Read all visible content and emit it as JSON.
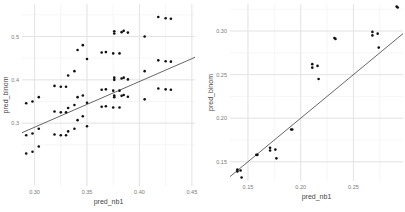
{
  "chart_data": [
    {
      "type": "scatter",
      "title": "",
      "xlabel": "pred_nb1",
      "ylabel": "pred_binom",
      "xlim": [
        0.288,
        0.453
      ],
      "ylim": [
        0.155,
        0.575
      ],
      "x_ticks": [
        0.3,
        0.35,
        0.4,
        0.45
      ],
      "x_tick_labels": [
        "0.30",
        "0.35",
        "0.40",
        "0.45"
      ],
      "y_ticks": [
        0.3,
        0.4,
        0.5
      ],
      "y_tick_labels": [
        "0.3",
        "0.4",
        "0.5"
      ],
      "grid": true,
      "legend": null,
      "fit_line": {
        "x": [
          0.288,
          0.453
        ],
        "y": [
          0.278,
          0.452
        ]
      },
      "points": [
        {
          "x": 0.292,
          "y": 0.346
        },
        {
          "x": 0.298,
          "y": 0.35
        },
        {
          "x": 0.304,
          "y": 0.36
        },
        {
          "x": 0.292,
          "y": 0.272
        },
        {
          "x": 0.298,
          "y": 0.276
        },
        {
          "x": 0.304,
          "y": 0.287
        },
        {
          "x": 0.292,
          "y": 0.23
        },
        {
          "x": 0.298,
          "y": 0.234
        },
        {
          "x": 0.304,
          "y": 0.246
        },
        {
          "x": 0.319,
          "y": 0.386
        },
        {
          "x": 0.325,
          "y": 0.384
        },
        {
          "x": 0.33,
          "y": 0.384
        },
        {
          "x": 0.332,
          "y": 0.41
        },
        {
          "x": 0.338,
          "y": 0.42
        },
        {
          "x": 0.341,
          "y": 0.469
        },
        {
          "x": 0.346,
          "y": 0.48
        },
        {
          "x": 0.35,
          "y": 0.448
        },
        {
          "x": 0.319,
          "y": 0.327
        },
        {
          "x": 0.325,
          "y": 0.325
        },
        {
          "x": 0.33,
          "y": 0.325
        },
        {
          "x": 0.332,
          "y": 0.335
        },
        {
          "x": 0.338,
          "y": 0.342
        },
        {
          "x": 0.341,
          "y": 0.36
        },
        {
          "x": 0.346,
          "y": 0.364
        },
        {
          "x": 0.35,
          "y": 0.347
        },
        {
          "x": 0.319,
          "y": 0.274
        },
        {
          "x": 0.325,
          "y": 0.272
        },
        {
          "x": 0.33,
          "y": 0.272
        },
        {
          "x": 0.332,
          "y": 0.281
        },
        {
          "x": 0.338,
          "y": 0.287
        },
        {
          "x": 0.341,
          "y": 0.307
        },
        {
          "x": 0.346,
          "y": 0.316
        },
        {
          "x": 0.35,
          "y": 0.293
        },
        {
          "x": 0.364,
          "y": 0.463
        },
        {
          "x": 0.368,
          "y": 0.464
        },
        {
          "x": 0.375,
          "y": 0.461
        },
        {
          "x": 0.381,
          "y": 0.461
        },
        {
          "x": 0.376,
          "y": 0.512
        },
        {
          "x": 0.376,
          "y": 0.507
        },
        {
          "x": 0.383,
          "y": 0.51
        },
        {
          "x": 0.385,
          "y": 0.513
        },
        {
          "x": 0.389,
          "y": 0.509
        },
        {
          "x": 0.364,
          "y": 0.377
        },
        {
          "x": 0.368,
          "y": 0.378
        },
        {
          "x": 0.375,
          "y": 0.375
        },
        {
          "x": 0.381,
          "y": 0.375
        },
        {
          "x": 0.376,
          "y": 0.405
        },
        {
          "x": 0.376,
          "y": 0.4
        },
        {
          "x": 0.383,
          "y": 0.403
        },
        {
          "x": 0.385,
          "y": 0.405
        },
        {
          "x": 0.389,
          "y": 0.401
        },
        {
          "x": 0.364,
          "y": 0.338
        },
        {
          "x": 0.368,
          "y": 0.339
        },
        {
          "x": 0.375,
          "y": 0.336
        },
        {
          "x": 0.381,
          "y": 0.336
        },
        {
          "x": 0.376,
          "y": 0.364
        },
        {
          "x": 0.376,
          "y": 0.36
        },
        {
          "x": 0.383,
          "y": 0.363
        },
        {
          "x": 0.385,
          "y": 0.365
        },
        {
          "x": 0.389,
          "y": 0.361
        },
        {
          "x": 0.405,
          "y": 0.5
        },
        {
          "x": 0.405,
          "y": 0.42
        },
        {
          "x": 0.405,
          "y": 0.355
        },
        {
          "x": 0.418,
          "y": 0.545
        },
        {
          "x": 0.425,
          "y": 0.542
        },
        {
          "x": 0.43,
          "y": 0.541
        },
        {
          "x": 0.418,
          "y": 0.445
        },
        {
          "x": 0.425,
          "y": 0.443
        },
        {
          "x": 0.43,
          "y": 0.442
        },
        {
          "x": 0.418,
          "y": 0.38
        },
        {
          "x": 0.425,
          "y": 0.378
        },
        {
          "x": 0.43,
          "y": 0.377
        }
      ]
    },
    {
      "type": "scatter",
      "title": "",
      "xlabel": "pred_nb1",
      "ylabel": "pred_binom",
      "xlim": [
        0.133,
        0.297
      ],
      "ylim": [
        0.128,
        0.331
      ],
      "x_ticks": [
        0.15,
        0.2,
        0.25
      ],
      "x_tick_labels": [
        "0.15",
        "0.20",
        "0.25"
      ],
      "y_ticks": [
        0.15,
        0.2,
        0.25,
        0.3
      ],
      "y_tick_labels": [
        "0.15",
        "0.20",
        "0.25",
        "0.30"
      ],
      "grid": true,
      "legend": null,
      "fit_line": {
        "x": [
          0.133,
          0.297
        ],
        "y": [
          0.133,
          0.297
        ]
      },
      "points": [
        {
          "x": 0.14,
          "y": 0.141
        },
        {
          "x": 0.14,
          "y": 0.139
        },
        {
          "x": 0.143,
          "y": 0.14
        },
        {
          "x": 0.144,
          "y": 0.132
        },
        {
          "x": 0.158,
          "y": 0.158
        },
        {
          "x": 0.159,
          "y": 0.158
        },
        {
          "x": 0.171,
          "y": 0.166
        },
        {
          "x": 0.171,
          "y": 0.163
        },
        {
          "x": 0.176,
          "y": 0.164
        },
        {
          "x": 0.177,
          "y": 0.154
        },
        {
          "x": 0.191,
          "y": 0.187
        },
        {
          "x": 0.192,
          "y": 0.187
        },
        {
          "x": 0.211,
          "y": 0.262
        },
        {
          "x": 0.211,
          "y": 0.258
        },
        {
          "x": 0.216,
          "y": 0.26
        },
        {
          "x": 0.217,
          "y": 0.245
        },
        {
          "x": 0.232,
          "y": 0.292
        },
        {
          "x": 0.233,
          "y": 0.291
        },
        {
          "x": 0.268,
          "y": 0.299
        },
        {
          "x": 0.268,
          "y": 0.295
        },
        {
          "x": 0.273,
          "y": 0.297
        },
        {
          "x": 0.274,
          "y": 0.281
        },
        {
          "x": 0.291,
          "y": 0.328
        },
        {
          "x": 0.292,
          "y": 0.327
        }
      ]
    }
  ],
  "panels": {
    "left": {
      "xlabel": "pred_nb1",
      "ylabel": "pred_binom"
    },
    "right": {
      "xlabel": "pred_nb1",
      "ylabel": "pred_binom"
    }
  },
  "colors": {
    "point": "#111111",
    "line": "#555555",
    "grid": "#e2e2e2",
    "background": "#ffffff"
  }
}
